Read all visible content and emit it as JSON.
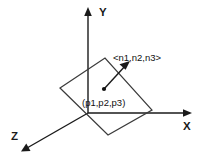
{
  "diagram": {
    "background_color": "#ffffff",
    "stroke_color": "#1a1a1a",
    "plane_stroke_color": "#3a3a3a",
    "axes": [
      {
        "id": "y-axis",
        "label": "Y",
        "direction": "up",
        "label_x": 99,
        "label_y": 16,
        "line": {
          "x1": 88,
          "y1": 113,
          "x2": 88,
          "y2": 12
        },
        "arrow_points": "88,7 84.2,16 91.8,16"
      },
      {
        "id": "x-axis",
        "label": "X",
        "direction": "right",
        "label_x": 183,
        "label_y": 130,
        "line": {
          "x1": 88,
          "y1": 113,
          "x2": 186,
          "y2": 113
        },
        "arrow_points": "192,113 183,109.2 183,116.8"
      },
      {
        "id": "z-axis",
        "label": "Z",
        "direction": "down-left",
        "label_x": 11,
        "label_y": 140,
        "line": {
          "x1": 88,
          "y1": 113,
          "x2": 27,
          "y2": 148
        },
        "arrow_points": "21,151.5 30.5,151.0 26.3,143.6"
      }
    ],
    "plane": {
      "name": "plane-parallelogram",
      "points": "60,88 105,58 152,110 108,135"
    },
    "normal_vector": {
      "name": "normal-vector",
      "label": "<n1,n2,n3>",
      "label_x": 113,
      "label_y": 61,
      "line": {
        "x1": 104,
        "y1": 89,
        "x2": 126,
        "y2": 65
      },
      "arrow_points": "130,61 119.5,64.2 125.6,69.8"
    },
    "point": {
      "name": "plane-point",
      "label": "(p1,p2,p3)",
      "dot_x": 104,
      "dot_y": 89,
      "dot_r": 2.1,
      "label_x": 82,
      "label_y": 106
    }
  }
}
